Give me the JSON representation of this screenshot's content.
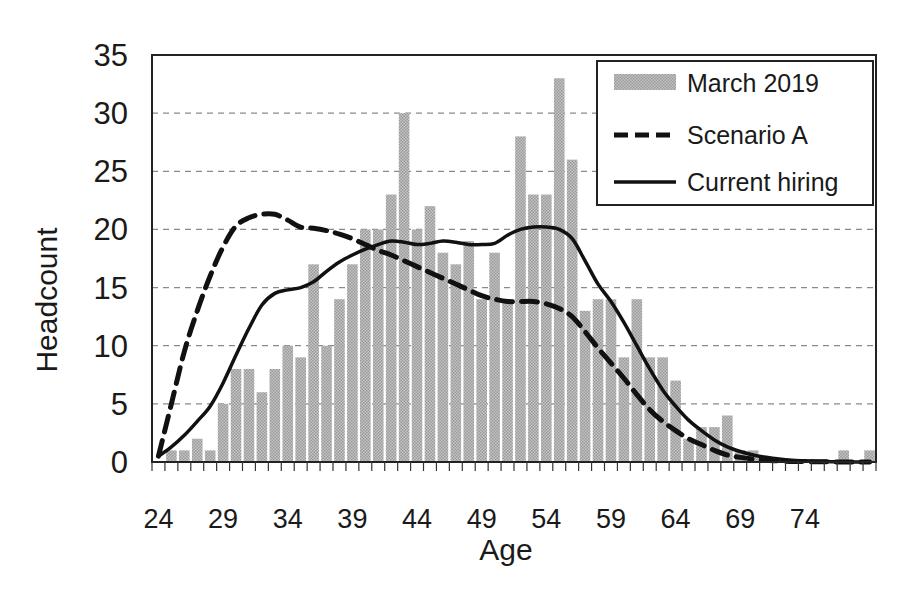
{
  "chart_data": {
    "type": "bar",
    "title": "",
    "xlabel": "Age",
    "ylabel": "Headcount",
    "ylim": [
      0,
      35
    ],
    "yticks": [
      0,
      5,
      10,
      15,
      20,
      25,
      30,
      35
    ],
    "xtick_labels": [
      "24",
      "29",
      "34",
      "39",
      "44",
      "49",
      "54",
      "59",
      "64",
      "69",
      "74"
    ],
    "grid": "horizontal dashed",
    "legend_position": "upper right",
    "categories": [
      24,
      25,
      26,
      27,
      28,
      29,
      30,
      31,
      32,
      33,
      34,
      35,
      36,
      37,
      38,
      39,
      40,
      41,
      42,
      43,
      44,
      45,
      46,
      47,
      48,
      49,
      50,
      51,
      52,
      53,
      54,
      55,
      56,
      57,
      58,
      59,
      60,
      61,
      62,
      63,
      64,
      65,
      66,
      67,
      68,
      69,
      70,
      71,
      72,
      73,
      74,
      75,
      76,
      77,
      78,
      79
    ],
    "series": [
      {
        "name": "March 2019",
        "type": "bar",
        "color": "#b4b4b4",
        "values": [
          0,
          1,
          1,
          2,
          1,
          5,
          8,
          8,
          6,
          8,
          10,
          9,
          17,
          10,
          14,
          17,
          20,
          20,
          23,
          30,
          20,
          22,
          18,
          17,
          19,
          14,
          18,
          14,
          28,
          23,
          23,
          33,
          26,
          13,
          14,
          14,
          9,
          14,
          9,
          9,
          7,
          2,
          3,
          3,
          4,
          1,
          1,
          0,
          0,
          0,
          0,
          0,
          0,
          1,
          0,
          1
        ]
      },
      {
        "name": "Scenario A",
        "type": "line",
        "style": "dashed",
        "color": "#111111",
        "values": [
          0.5,
          5,
          9.5,
          13,
          16,
          18.5,
          20.3,
          21,
          21.3,
          21.3,
          20.8,
          20.2,
          20.1,
          19.9,
          19.6,
          19.2,
          18.7,
          18.2,
          17.8,
          17.3,
          16.8,
          16.3,
          15.8,
          15.3,
          14.8,
          14.3,
          14,
          13.8,
          13.8,
          13.8,
          13.6,
          13.2,
          12.5,
          11.2,
          9.8,
          8.5,
          7.2,
          5.8,
          4.5,
          3.5,
          2.7,
          2,
          1.5,
          1,
          0.6,
          0.4,
          0.25,
          0.15,
          0.1,
          0.05,
          0.03,
          0.02,
          0.01,
          0,
          0,
          0
        ]
      },
      {
        "name": "Current hiring",
        "type": "line",
        "style": "solid",
        "color": "#111111",
        "values": [
          0.5,
          1.3,
          2.3,
          3.5,
          4.8,
          6.8,
          9.2,
          11.5,
          13.5,
          14.5,
          14.8,
          15,
          15.5,
          16.4,
          17.2,
          17.8,
          18.3,
          18.7,
          19,
          18.9,
          18.7,
          18.8,
          19,
          18.9,
          18.7,
          18.7,
          18.8,
          19.5,
          20,
          20.2,
          20.2,
          20,
          19.2,
          17.3,
          15.3,
          13.8,
          12,
          10,
          8,
          6.2,
          4.8,
          3.6,
          2.7,
          1.9,
          1.3,
          0.9,
          0.6,
          0.4,
          0.25,
          0.15,
          0.1,
          0.05,
          0.03,
          0.02,
          0.01,
          0
        ]
      }
    ]
  },
  "legend": {
    "items": [
      {
        "label": "March 2019",
        "kind": "bar"
      },
      {
        "label": "Scenario A",
        "kind": "dashed"
      },
      {
        "label": "Current hiring",
        "kind": "solid"
      }
    ]
  },
  "axes": {
    "x_title": "Age",
    "y_title": "Headcount"
  }
}
